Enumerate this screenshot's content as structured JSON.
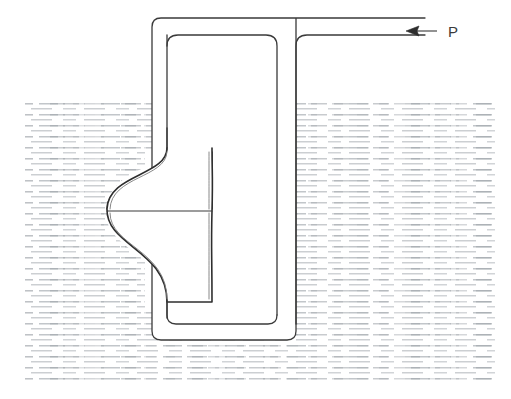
{
  "figure": {
    "background_color": "#ffffff",
    "line_color": "#3a3a3a",
    "line_width": 1.2
  },
  "liquid": {
    "name": "liquid-bath",
    "hatch_style": "short-horizontal-dashes",
    "hatch_color": "#9aa0a6",
    "surface_label": "",
    "bounds": {
      "x": 25,
      "y": 103,
      "width": 470,
      "height": 278
    },
    "surface_y": 103,
    "bottom_y": 381,
    "left_x": 25,
    "right_x": 495,
    "dash_row_spacing": 11,
    "dash_length_min": 9,
    "dash_length_max": 24
  },
  "tube": {
    "name": "u-tube",
    "outer_left_x": 152,
    "inner_left_x": 167,
    "right_limb_inner_x": 277,
    "right_limb_outer_x": 296,
    "top_y": 18,
    "inner_top_y": 35,
    "bottom_outer_y": 340,
    "bottom_inner_y": 324,
    "open_end_x": 425,
    "corner_radius": 9,
    "inner_corner_radius": 11
  },
  "capsule": {
    "name": "bellows-capsule",
    "left_x": 107,
    "right_x": 212,
    "top_y": 168,
    "bottom_y": 292,
    "seam_y": 211,
    "neck_top_y": 160,
    "neck_bottom_y": 300,
    "lobes": 2
  },
  "annotation": {
    "pressure": {
      "label": "P",
      "arrow_tip_x": 407,
      "arrow_tail_x": 437,
      "arrow_y": 31,
      "label_x": 448,
      "label_y": 37,
      "direction": "left"
    }
  }
}
